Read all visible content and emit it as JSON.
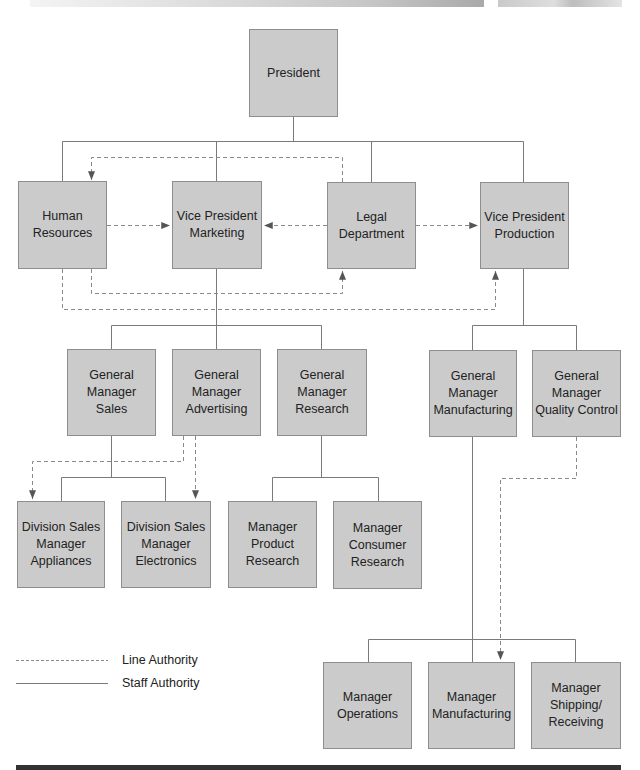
{
  "org_chart": {
    "nodes": {
      "president": "President",
      "human_resources": "Human\nResources",
      "vp_marketing": "Vice President\nMarketing",
      "legal_department": "Legal\nDepartment",
      "vp_production": "Vice President\nProduction",
      "gm_sales": "General\nManager\nSales",
      "gm_advertising": "General\nManager\nAdvertising",
      "gm_research": "General\nManager\nResearch",
      "gm_manufacturing": "General\nManager\nManufacturing",
      "gm_quality_control": "General\nManager\nQuality Control",
      "dsm_appliances": "Division Sales\nManager\nAppliances",
      "dsm_electronics": "Division Sales\nManager\nElectronics",
      "mgr_product_research": "Manager\nProduct\nResearch",
      "mgr_consumer_research": "Manager\nConsumer\nResearch",
      "mgr_operations": "Manager\nOperations",
      "mgr_manufacturing": "Manager\nManufacturing",
      "mgr_shipping_receiving": "Manager\nShipping/\nReceiving"
    },
    "edges": [
      {
        "from": "president",
        "to": "human_resources",
        "type": "solid"
      },
      {
        "from": "president",
        "to": "vp_marketing",
        "type": "solid"
      },
      {
        "from": "president",
        "to": "legal_department",
        "type": "solid"
      },
      {
        "from": "president",
        "to": "vp_production",
        "type": "solid"
      },
      {
        "from": "vp_marketing",
        "to": "gm_sales",
        "type": "solid"
      },
      {
        "from": "vp_marketing",
        "to": "gm_advertising",
        "type": "solid"
      },
      {
        "from": "vp_marketing",
        "to": "gm_research",
        "type": "solid"
      },
      {
        "from": "gm_sales",
        "to": "dsm_appliances",
        "type": "solid"
      },
      {
        "from": "gm_sales",
        "to": "dsm_electronics",
        "type": "solid"
      },
      {
        "from": "gm_research",
        "to": "mgr_product_research",
        "type": "solid"
      },
      {
        "from": "gm_research",
        "to": "mgr_consumer_research",
        "type": "solid"
      },
      {
        "from": "vp_production",
        "to": "gm_manufacturing",
        "type": "solid"
      },
      {
        "from": "vp_production",
        "to": "gm_quality_control",
        "type": "solid"
      },
      {
        "from": "gm_manufacturing",
        "to": "mgr_operations",
        "type": "solid"
      },
      {
        "from": "gm_manufacturing",
        "to": "mgr_manufacturing",
        "type": "solid"
      },
      {
        "from": "gm_manufacturing",
        "to": "mgr_shipping_receiving",
        "type": "solid"
      },
      {
        "from": "legal_department",
        "to": "human_resources",
        "type": "dashed-arrow"
      },
      {
        "from": "human_resources",
        "to": "vp_marketing",
        "type": "dashed-arrow"
      },
      {
        "from": "legal_department",
        "to": "vp_marketing",
        "type": "dashed-arrow"
      },
      {
        "from": "legal_department",
        "to": "vp_production",
        "type": "dashed-arrow"
      },
      {
        "from": "human_resources",
        "to": "legal_department",
        "type": "dashed-arrow"
      },
      {
        "from": "human_resources",
        "to": "vp_production",
        "type": "dashed-arrow"
      },
      {
        "from": "gm_advertising",
        "to": "dsm_appliances",
        "type": "dashed-arrow"
      },
      {
        "from": "gm_advertising",
        "to": "dsm_electronics",
        "type": "dashed-arrow"
      },
      {
        "from": "gm_quality_control",
        "to": "mgr_manufacturing",
        "type": "dashed-arrow"
      }
    ]
  },
  "legend": {
    "dashed_label": "Line Authority",
    "solid_label": "Staff Authority"
  },
  "colors": {
    "box_fill": "#cbcbcb",
    "box_border": "#8e8e8e",
    "line": "#7a7a7a",
    "arrow": "#555555"
  }
}
